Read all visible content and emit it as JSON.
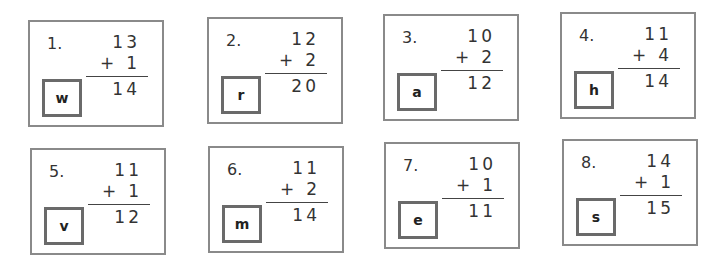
{
  "cards": [
    {
      "number": "1.",
      "top": "13",
      "operator": "+",
      "addend": "1",
      "answer": "14",
      "letter": "w",
      "x": 28,
      "y": 20
    },
    {
      "number": "2.",
      "top": "12",
      "operator": "+",
      "addend": "2",
      "answer": "20",
      "letter": "r",
      "x": 207,
      "y": 17
    },
    {
      "number": "3.",
      "top": "10",
      "operator": "+",
      "addend": "2",
      "answer": "12",
      "letter": "a",
      "x": 383,
      "y": 14
    },
    {
      "number": "4.",
      "top": "11",
      "operator": "+",
      "addend": "4",
      "answer": "14",
      "letter": "h",
      "x": 560,
      "y": 12
    },
    {
      "number": "5.",
      "top": "11",
      "operator": "+",
      "addend": "1",
      "answer": "12",
      "letter": "v",
      "x": 30,
      "y": 148
    },
    {
      "number": "6.",
      "top": "11",
      "operator": "+",
      "addend": "2",
      "answer": "14",
      "letter": "m",
      "x": 208,
      "y": 146
    },
    {
      "number": "7.",
      "top": "10",
      "operator": "+",
      "addend": "1",
      "answer": "11",
      "letter": "e",
      "x": 384,
      "y": 142
    },
    {
      "number": "8.",
      "top": "14",
      "operator": "+",
      "addend": "1",
      "answer": "15",
      "letter": "s",
      "x": 562,
      "y": 139
    }
  ]
}
